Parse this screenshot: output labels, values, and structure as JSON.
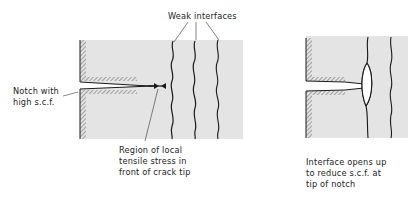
{
  "figure": {
    "left_panel": {
      "label_weak_interfaces": "Weak interfaces",
      "label_notch": [
        "Notch with",
        "high s.c.f."
      ],
      "label_region": [
        "Region of local",
        "tensile stress in",
        "front of crack tip"
      ]
    },
    "right_panel": {
      "label_interface_opens": [
        "Interface opens up",
        "to reduce s.c.f. at",
        "tip of notch"
      ]
    },
    "colors": {
      "material_fill": "#e4e4e4",
      "line": "#1a1a1a",
      "background": "#ffffff"
    }
  }
}
